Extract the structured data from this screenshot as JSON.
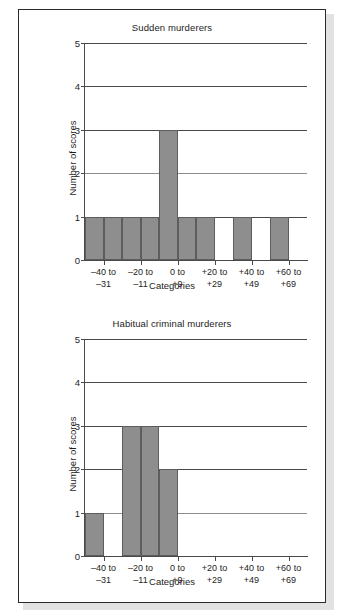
{
  "figure": {
    "background_color": "#ffffff",
    "frame_border_color": "#2b2b2b",
    "shadow_color": "#e2e2e2",
    "bar_fill_color": "#8e8e8e",
    "bar_edge_color": "#5d5d5d",
    "axis_color": "#4a4a4a",
    "text_color": "#1d1d1d"
  },
  "chart_data": [
    {
      "type": "bar",
      "title": "Sudden murderers",
      "xlabel": "Categories",
      "ylabel": "Number of scores",
      "ylim": [
        0,
        5
      ],
      "yticks": [
        0,
        1,
        2,
        3,
        4,
        5
      ],
      "ytick_labels": [
        "0",
        "1",
        "2",
        "3",
        "4",
        "5"
      ],
      "grid": true,
      "legend": "none",
      "categories": [
        "–40 to –31",
        "–20 to –11",
        "0 to +9",
        "+20 to +29",
        "+40 to +49",
        "+60 to +69"
      ],
      "bins": [
        "–40 to –31",
        "–30 to –21",
        "–20 to –11",
        "–10 to –1",
        "0 to +9",
        "+10 to +19",
        "+20 to +29",
        "+30 to +39",
        "+40 to +49",
        "+50 to +59",
        "+60 to +69",
        "+70 to +79"
      ],
      "values": [
        1,
        1,
        1,
        1,
        3,
        1,
        1,
        0,
        1,
        0,
        1,
        0
      ]
    },
    {
      "type": "bar",
      "title": "Habitual criminal murderers",
      "xlabel": "Categories",
      "ylabel": "Number of scores",
      "ylim": [
        0,
        5
      ],
      "yticks": [
        0,
        1,
        2,
        3,
        4,
        5
      ],
      "ytick_labels": [
        "0",
        "1",
        "2",
        "3",
        "4",
        "5"
      ],
      "grid": true,
      "legend": "none",
      "categories": [
        "–40 to –31",
        "–20 to –11",
        "0 to +9",
        "+20 to +29",
        "+40 to +49",
        "+60 to +69"
      ],
      "bins": [
        "–40 to –31",
        "–30 to –21",
        "–20 to –11",
        "–10 to –1",
        "0 to +9",
        "+10 to +19",
        "+20 to +29",
        "+30 to +39",
        "+40 to +49",
        "+50 to +59",
        "+60 to +69",
        "+70 to +79"
      ],
      "values": [
        1,
        0,
        3,
        3,
        2,
        0,
        0,
        0,
        0,
        0,
        0,
        0
      ]
    }
  ]
}
